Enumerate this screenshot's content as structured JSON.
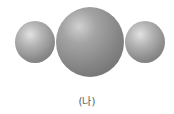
{
  "diagram": {
    "type": "linear triatomic molecular model",
    "atoms": [
      {
        "position": "left",
        "size": "small",
        "color": "#a0a0a0"
      },
      {
        "position": "center",
        "size": "large",
        "color": "#8a8a8a"
      },
      {
        "position": "right",
        "size": "small",
        "color": "#a0a0a0"
      }
    ],
    "label": "(나)"
  }
}
